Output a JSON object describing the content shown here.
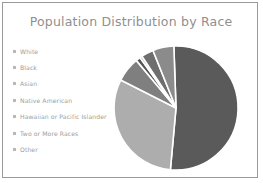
{
  "chart_data": {
    "type": "pie",
    "title": "Population Distribution by Race",
    "xlabel": "",
    "ylabel": "",
    "legend_position": "left",
    "grid": false,
    "categories": [
      "White",
      "Black",
      "Asian",
      "Native American",
      "Hawaiian or Pacific Islander",
      "Two or More Races",
      "Other"
    ],
    "values": [
      52.0,
      31.0,
      6.5,
      1.2,
      0.6,
      3.2,
      5.5
    ],
    "unit": "percent",
    "colors": [
      "#5a5a5a",
      "#adadad",
      "#7f7f7f",
      "#545454",
      "#9a9a9a",
      "#6e6e6e",
      "#8b8b8b"
    ],
    "start_angle": -2,
    "separator_color": "#ffffff",
    "separator_width": 1.6,
    "center": [
      68,
      67
    ],
    "radius": 62
  },
  "frame": {
    "border_color": "#9a9a9a",
    "background": "#ffffff"
  },
  "legend": {
    "marker_icon": "square-bullet-icon",
    "items": [
      {
        "label": "White"
      },
      {
        "label": "Black"
      },
      {
        "label": "Asian"
      },
      {
        "label": "Native American"
      },
      {
        "label": "Hawaiian or Pacific Islander"
      },
      {
        "label": "Two or More Races"
      },
      {
        "label": "Other"
      }
    ]
  }
}
